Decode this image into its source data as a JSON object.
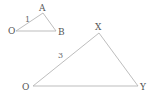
{
  "diagram": {
    "colors": {
      "line": "#b5b5b5",
      "text": "#555555",
      "background": "#ffffff"
    },
    "small_triangle": {
      "vertices": {
        "o": "O",
        "a": "A",
        "b": "B"
      },
      "side_label": "1"
    },
    "large_triangle": {
      "vertices": {
        "o": "O",
        "x": "X",
        "y": "Y"
      },
      "side_label": "3"
    }
  }
}
